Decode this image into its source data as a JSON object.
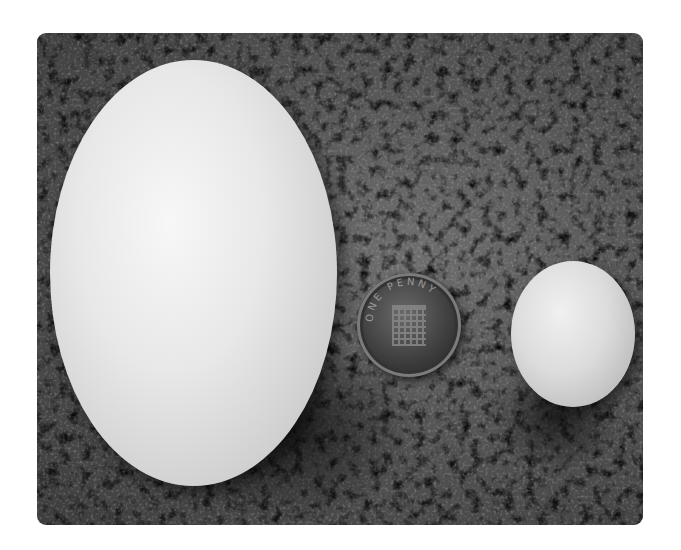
{
  "image": {
    "description": "Photograph of a large egg, a one-penny coin, and a small egg resting on a porous sponge-like surface, in grayscale with rounded corners",
    "objects": [
      {
        "name": "large-egg",
        "label": "Large egg"
      },
      {
        "name": "coin",
        "label": "One penny coin",
        "inscription": "ONE PENNY"
      },
      {
        "name": "small-egg",
        "label": "Small egg"
      }
    ],
    "background": "porous sponge texture",
    "colors": {
      "frame": "#ffffff",
      "texture_mid": "#555555",
      "egg_highlight": "#f7f7f7",
      "coin_dark": "#2a2a2a"
    }
  }
}
